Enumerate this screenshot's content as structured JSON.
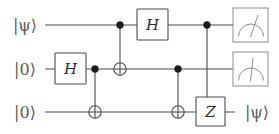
{
  "diagram": {
    "type": "quantum-circuit",
    "background_color": "#ffffff",
    "wire_color": "#4a4a4a",
    "label_color": "#5a5a5a",
    "gate_text_color": "#2b2b2b",
    "meter_color": "#8d8d8d"
  },
  "wires": [
    {
      "index": 0,
      "input_label": "|ψ⟩",
      "y": 25,
      "output_label": ""
    },
    {
      "index": 1,
      "input_label": "|0⟩",
      "y": 69,
      "output_label": ""
    },
    {
      "index": 2,
      "input_label": "|0⟩",
      "y": 112,
      "output_label": "|ψ⟩"
    }
  ],
  "gates": [
    {
      "id": "h-wire2",
      "symbol": "H",
      "name": "hadamard-gate",
      "wire": 1,
      "x": 71
    },
    {
      "id": "h-wire1",
      "symbol": "H",
      "name": "hadamard-gate",
      "wire": 0,
      "x": 153
    },
    {
      "id": "z-wire3",
      "symbol": "Z",
      "name": "pauli-z-gate",
      "wire": 2,
      "x": 210
    }
  ],
  "controlled_ops": [
    {
      "id": "cnot-1",
      "name": "cnot-gate",
      "control_wire": 1,
      "target_wire": 2,
      "x": 95
    },
    {
      "id": "cnot-2",
      "name": "cnot-gate",
      "control_wire": 0,
      "target_wire": 1,
      "x": 120
    },
    {
      "id": "cnot-3",
      "name": "cnot-gate",
      "control_wire": 1,
      "target_wire": 2,
      "x": 178
    },
    {
      "id": "cz-1",
      "name": "controlled-z-gate",
      "control_wire": 0,
      "target_wire": 2,
      "x": 207
    }
  ],
  "measurements": [
    {
      "id": "meter-wire1",
      "name": "measurement-meter",
      "wire": 0,
      "x": 250
    },
    {
      "id": "meter-wire2",
      "name": "measurement-meter",
      "wire": 1,
      "x": 250
    }
  ],
  "labels": {
    "input_wire_1": "|ψ⟩",
    "input_wire_2": "|0⟩",
    "input_wire_3": "|0⟩",
    "output_wire_3": "|ψ⟩",
    "gate_h_1": "H",
    "gate_h_2": "H",
    "gate_z": "Z"
  }
}
